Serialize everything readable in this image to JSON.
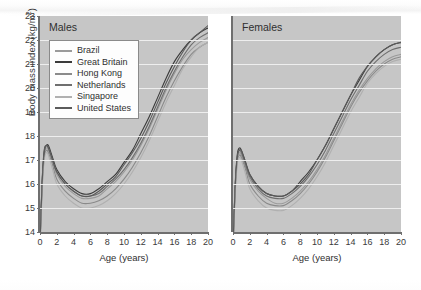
{
  "figure": {
    "y_axis_label": "Body mass index (kg/m",
    "y_axis_label_exp": "2",
    "y_axis_label_tail": ")",
    "x_axis_label": "Age (years)"
  },
  "legend": {
    "entries": [
      {
        "label": "Brazil",
        "color": "#9a9a9a"
      },
      {
        "label": "Great Britain",
        "color": "#3b3b3b"
      },
      {
        "label": "Hong Kong",
        "color": "#8a8a8a"
      },
      {
        "label": "Netherlands",
        "color": "#6e6e6e"
      },
      {
        "label": "Singapore",
        "color": "#b0b0b0"
      },
      {
        "label": "United States",
        "color": "#5a5a5a"
      }
    ]
  },
  "panels": [
    {
      "key": "males",
      "title": "Males"
    },
    {
      "key": "females",
      "title": "Females"
    }
  ],
  "chart_data": {
    "type": "line",
    "title": "",
    "xlabel": "Age (years)",
    "ylabel": "Body mass index (kg/m2)",
    "xlim": [
      0,
      20
    ],
    "ylim": [
      14,
      23
    ],
    "xticks": [
      0,
      2,
      4,
      6,
      8,
      10,
      12,
      14,
      16,
      18,
      20
    ],
    "yticks": [
      14,
      15,
      16,
      17,
      18,
      19,
      20,
      21,
      22,
      23
    ],
    "grid": "horizontal",
    "legend_position": "upper-left-of-left-panel",
    "x": [
      0,
      0.25,
      0.5,
      0.75,
      1,
      1.5,
      2,
      3,
      4,
      5,
      6,
      7,
      8,
      9,
      10,
      11,
      12,
      13,
      14,
      15,
      16,
      17,
      18,
      19,
      20
    ],
    "panels": [
      {
        "name": "Males",
        "series": [
          {
            "name": "Brazil",
            "color": "#9a9a9a",
            "values": [
              13.4,
              15.9,
              17.2,
              17.5,
              17.4,
              16.9,
              16.4,
              15.9,
              15.6,
              15.4,
              15.4,
              15.5,
              15.8,
              16.1,
              16.5,
              17.0,
              17.6,
              18.3,
              19.1,
              19.9,
              20.6,
              21.2,
              21.6,
              21.9,
              22.1
            ]
          },
          {
            "name": "Great Britain",
            "color": "#3b3b3b",
            "values": [
              13.5,
              16.1,
              17.4,
              17.6,
              17.6,
              17.1,
              16.6,
              16.1,
              15.8,
              15.6,
              15.6,
              15.8,
              16.1,
              16.4,
              16.9,
              17.4,
              18.1,
              18.8,
              19.6,
              20.4,
              21.1,
              21.6,
              22.0,
              22.3,
              22.5
            ]
          },
          {
            "name": "Hong Kong",
            "color": "#8a8a8a",
            "values": [
              13.3,
              15.8,
              17.1,
              17.4,
              17.3,
              16.8,
              16.2,
              15.7,
              15.4,
              15.2,
              15.2,
              15.3,
              15.5,
              15.8,
              16.2,
              16.7,
              17.3,
              18.0,
              18.8,
              19.6,
              20.3,
              20.9,
              21.4,
              21.7,
              21.9
            ]
          },
          {
            "name": "Netherlands",
            "color": "#6e6e6e",
            "values": [
              13.5,
              16.0,
              17.3,
              17.6,
              17.5,
              17.0,
              16.5,
              16.0,
              15.7,
              15.5,
              15.5,
              15.6,
              15.9,
              16.2,
              16.6,
              17.1,
              17.7,
              18.4,
              19.2,
              20.0,
              20.7,
              21.3,
              21.8,
              22.1,
              22.3
            ]
          },
          {
            "name": "Singapore",
            "color": "#b0b0b0",
            "values": [
              13.2,
              15.7,
              17.0,
              17.3,
              17.2,
              16.6,
              16.0,
              15.5,
              15.2,
              15.0,
              15.0,
              15.1,
              15.3,
              15.6,
              16.0,
              16.5,
              17.1,
              17.8,
              18.6,
              19.4,
              20.1,
              20.8,
              21.3,
              21.7,
              21.9
            ]
          },
          {
            "name": "United States",
            "color": "#5a5a5a",
            "values": [
              13.5,
              16.0,
              17.3,
              17.6,
              17.5,
              17.0,
              16.5,
              16.0,
              15.7,
              15.5,
              15.5,
              15.7,
              16.0,
              16.3,
              16.8,
              17.3,
              17.9,
              18.6,
              19.4,
              20.2,
              20.9,
              21.5,
              22.0,
              22.3,
              22.6
            ]
          }
        ]
      },
      {
        "name": "Females",
        "series": [
          {
            "name": "Brazil",
            "color": "#9a9a9a",
            "values": [
              13.3,
              15.7,
              17.0,
              17.3,
              17.2,
              16.7,
              16.2,
              15.7,
              15.4,
              15.2,
              15.2,
              15.4,
              15.7,
              16.1,
              16.6,
              17.2,
              17.9,
              18.6,
              19.3,
              19.9,
              20.4,
              20.8,
              21.1,
              21.3,
              21.4
            ]
          },
          {
            "name": "Great Britain",
            "color": "#3b3b3b",
            "values": [
              13.4,
              15.9,
              17.2,
              17.5,
              17.4,
              16.9,
              16.4,
              15.9,
              15.6,
              15.5,
              15.5,
              15.7,
              16.1,
              16.5,
              17.0,
              17.6,
              18.3,
              19.0,
              19.7,
              20.3,
              20.9,
              21.3,
              21.6,
              21.8,
              21.9
            ]
          },
          {
            "name": "Hong Kong",
            "color": "#8a8a8a",
            "values": [
              13.2,
              15.6,
              16.9,
              17.2,
              17.1,
              16.6,
              16.0,
              15.5,
              15.2,
              15.1,
              15.1,
              15.3,
              15.6,
              16.0,
              16.5,
              17.1,
              17.8,
              18.5,
              19.2,
              19.8,
              20.3,
              20.7,
              21.0,
              21.2,
              21.3
            ]
          },
          {
            "name": "Netherlands",
            "color": "#6e6e6e",
            "values": [
              13.4,
              15.8,
              17.1,
              17.4,
              17.3,
              16.8,
              16.3,
              15.8,
              15.5,
              15.4,
              15.4,
              15.6,
              15.9,
              16.3,
              16.8,
              17.4,
              18.1,
              18.8,
              19.5,
              20.1,
              20.7,
              21.1,
              21.4,
              21.6,
              21.7
            ]
          },
          {
            "name": "Singapore",
            "color": "#b0b0b0",
            "values": [
              13.1,
              15.5,
              16.8,
              17.1,
              17.0,
              16.4,
              15.8,
              15.3,
              15.0,
              14.9,
              14.9,
              15.1,
              15.4,
              15.8,
              16.3,
              16.9,
              17.6,
              18.3,
              19.0,
              19.6,
              20.2,
              20.6,
              20.9,
              21.1,
              21.2
            ]
          },
          {
            "name": "United States",
            "color": "#5a5a5a",
            "values": [
              13.4,
              15.8,
              17.1,
              17.4,
              17.4,
              16.9,
              16.4,
              15.9,
              15.6,
              15.5,
              15.5,
              15.7,
              16.0,
              16.4,
              17.0,
              17.6,
              18.3,
              19.0,
              19.7,
              20.4,
              20.9,
              21.3,
              21.6,
              21.8,
              21.9
            ]
          }
        ]
      }
    ]
  }
}
